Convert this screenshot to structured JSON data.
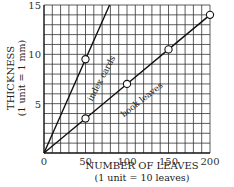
{
  "chart_data": {
    "type": "line",
    "title": "",
    "xlabel": "NUMBER OF LEAVES",
    "xlabel_unit": "(1 unit = 10 leaves)",
    "ylabel": "THICKNESS",
    "ylabel_unit": "(1 unit = 1 mm)",
    "xlim": [
      0,
      200
    ],
    "ylim": [
      0,
      15
    ],
    "x_ticks": [
      "0",
      "50",
      "100",
      "150",
      "200"
    ],
    "y_ticks": [
      "5",
      "10",
      "15"
    ],
    "grid": true,
    "series": [
      {
        "name": "index cards",
        "points": [
          [
            0,
            0
          ],
          [
            50,
            9.5
          ],
          [
            79,
            15
          ]
        ],
        "marked_points": [
          [
            50,
            9.5
          ]
        ]
      },
      {
        "name": "book leaves",
        "points": [
          [
            0,
            0
          ],
          [
            50,
            3.5
          ],
          [
            100,
            7
          ],
          [
            150,
            10.5
          ],
          [
            200,
            14
          ]
        ],
        "marked_points": [
          [
            50,
            3.5
          ],
          [
            100,
            7
          ],
          [
            150,
            10.5
          ],
          [
            200,
            14
          ]
        ]
      }
    ]
  }
}
